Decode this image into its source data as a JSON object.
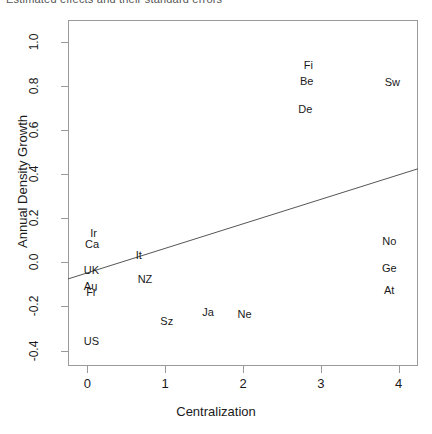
{
  "header": {
    "clipped_text": "Estimated effects and their standard errors"
  },
  "chart_data": {
    "type": "scatter",
    "title": "",
    "xlabel": "Centralization",
    "ylabel": "Annual Density Growth",
    "xlim": [
      -0.25,
      4.25
    ],
    "ylim": [
      -0.47,
      1.1
    ],
    "xticks": [
      0,
      1,
      2,
      3,
      4
    ],
    "xtick_labels": [
      "0",
      "1",
      "2",
      "3",
      "4"
    ],
    "yticks": [
      -0.4,
      -0.2,
      0.0,
      0.2,
      0.4,
      0.6,
      0.8,
      1.0
    ],
    "ytick_labels": [
      "-0.4",
      "-0.2",
      "0.0",
      "0.2",
      "0.4",
      "0.6",
      "0.8",
      "1.0"
    ],
    "grid": false,
    "legend": "none",
    "marker_style": "text-label",
    "points": [
      {
        "label": "Fi",
        "x": 2.84,
        "y": 0.895
      },
      {
        "label": "Be",
        "x": 2.82,
        "y": 0.825
      },
      {
        "label": "Sw",
        "x": 3.92,
        "y": 0.82
      },
      {
        "label": "De",
        "x": 2.8,
        "y": 0.695
      },
      {
        "label": "Ir",
        "x": 0.08,
        "y": 0.135
      },
      {
        "label": "Ca",
        "x": 0.06,
        "y": 0.085
      },
      {
        "label": "No",
        "x": 3.88,
        "y": 0.095
      },
      {
        "label": "It",
        "x": 0.66,
        "y": 0.035
      },
      {
        "label": "UK",
        "x": 0.05,
        "y": -0.035
      },
      {
        "label": "Ge",
        "x": 3.88,
        "y": -0.025
      },
      {
        "label": "NZ",
        "x": 0.74,
        "y": -0.075
      },
      {
        "label": "Au",
        "x": 0.04,
        "y": -0.105
      },
      {
        "label": "At",
        "x": 3.88,
        "y": -0.125
      },
      {
        "label": "Fr",
        "x": 0.05,
        "y": -0.135
      },
      {
        "label": "Ja",
        "x": 1.55,
        "y": -0.225
      },
      {
        "label": "Ne",
        "x": 2.02,
        "y": -0.235
      },
      {
        "label": "Sz",
        "x": 1.02,
        "y": -0.265
      },
      {
        "label": "US",
        "x": 0.05,
        "y": -0.355
      }
    ],
    "fit_line": {
      "type": "linear",
      "x_start": -0.25,
      "y_start": -0.075,
      "x_end": 4.25,
      "y_end": 0.425
    },
    "colors": {
      "axis": "#9a9a9a",
      "text": "#1a1a1a",
      "line": "#555555",
      "background": "#ffffff"
    }
  }
}
